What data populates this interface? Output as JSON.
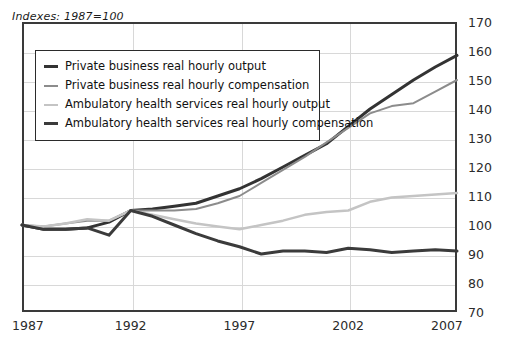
{
  "subtitle": "Indexes: 1987=100",
  "legend": {
    "items": [
      {
        "label": "Private business real hourly output",
        "color": "#333333",
        "width": 3
      },
      {
        "label": "Private business real hourly compensation",
        "color": "#8c8c8c",
        "width": 2
      },
      {
        "label": "Ambulatory health services real hourly output",
        "color": "#c4c4c4",
        "width": 2.5
      },
      {
        "label": "Ambulatory health services real hourly compensation",
        "color": "#3b3b3b",
        "width": 3
      }
    ]
  },
  "axes": {
    "y_ticks": [
      "70",
      "80",
      "90",
      "100",
      "110",
      "120",
      "130",
      "140",
      "150",
      "160",
      "170"
    ],
    "x_ticks": [
      "1987",
      "1992",
      "1997",
      "2002",
      "2007"
    ]
  },
  "chart_data": {
    "type": "line",
    "title": "",
    "subtitle": "Indexes: 1987=100",
    "xlabel": "",
    "ylabel": "",
    "xlim": [
      1987,
      2007
    ],
    "ylim": [
      70,
      170
    ],
    "y_tick_values": [
      70,
      80,
      90,
      100,
      110,
      120,
      130,
      140,
      150,
      160,
      170
    ],
    "x_tick_values": [
      1987,
      1992,
      1997,
      2002,
      2007
    ],
    "grid": "horizontal-and-vertical",
    "legend_position": "upper-left-inside",
    "x": [
      1987,
      1988,
      1989,
      1990,
      1991,
      1992,
      1993,
      1994,
      1995,
      1996,
      1997,
      1998,
      1999,
      2000,
      2001,
      2002,
      2003,
      2004,
      2005,
      2006,
      2007
    ],
    "series": [
      {
        "name": "Private business real hourly output",
        "color": "#333333",
        "values": [
          100,
          98.5,
          98.5,
          99.0,
          101.0,
          105.0,
          105.5,
          106.5,
          107.5,
          110.0,
          112.5,
          116.0,
          120.0,
          124.0,
          128.0,
          134.0,
          140.0,
          145.0,
          150.0,
          154.5,
          158.5
        ]
      },
      {
        "name": "Private business real hourly compensation",
        "color": "#8c8c8c",
        "values": [
          100,
          99.5,
          100.5,
          101.5,
          101.5,
          105.0,
          105.0,
          105.0,
          105.5,
          107.5,
          110.0,
          114.5,
          119.0,
          123.5,
          128.5,
          133.5,
          138.5,
          141.0,
          142.0,
          146.0,
          150.0
        ]
      },
      {
        "name": "Ambulatory health services real hourly output",
        "color": "#c4c4c4",
        "values": [
          100,
          99.5,
          100.5,
          102.0,
          101.5,
          105.0,
          103.5,
          102.0,
          100.5,
          99.5,
          98.5,
          100.0,
          101.5,
          103.5,
          104.5,
          105.0,
          108.0,
          109.5,
          110.0,
          110.5,
          111.0
        ]
      },
      {
        "name": "Ambulatory health services real hourly compensation",
        "color": "#3b3b3b",
        "values": [
          100,
          98.5,
          98.5,
          99.0,
          96.5,
          105.0,
          103.0,
          100.0,
          97.0,
          94.5,
          92.5,
          90.0,
          91.0,
          91.0,
          90.5,
          92.0,
          91.5,
          90.5,
          91.0,
          91.5,
          91.0
        ]
      }
    ]
  }
}
